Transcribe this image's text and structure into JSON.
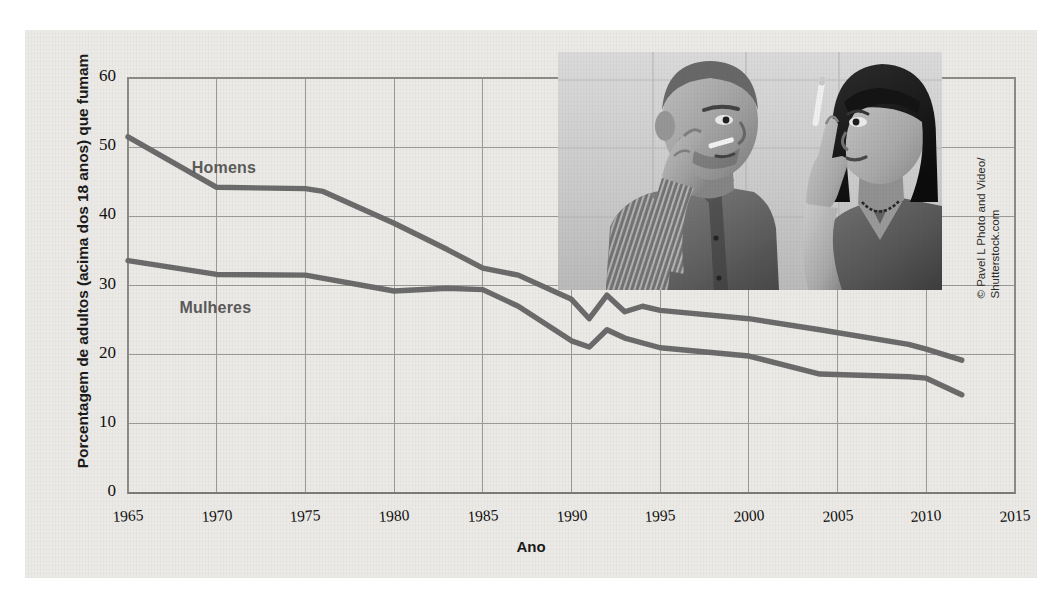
{
  "figure": {
    "background_color": "#eceae6",
    "credit": {
      "line1": "© Pavel L Photo and Video/",
      "line2": "Shutterstock.com"
    },
    "photo_alt": "Homem e mulher fumando cigarros"
  },
  "chart_data": {
    "type": "line",
    "title": "",
    "xlabel": "Ano",
    "ylabel": "Porcentagem de adultos (acima dos 18 anos) que fumam",
    "xlim": [
      1965,
      2015
    ],
    "ylim": [
      0,
      60
    ],
    "xticks": [
      1965,
      1970,
      1975,
      1980,
      1985,
      1990,
      1995,
      2000,
      2005,
      2010,
      2015
    ],
    "yticks": [
      0,
      10,
      20,
      30,
      40,
      50,
      60
    ],
    "grid": true,
    "legend_position": "inline-labels",
    "line_color": "#6b6b6b",
    "grid_color": "#9a9a98",
    "series": [
      {
        "name": "Homens",
        "label_x": 1968.6,
        "label_y": 46.8,
        "x": [
          1965,
          1970,
          1975,
          1976,
          1980,
          1983,
          1985,
          1987,
          1990,
          1991,
          1992,
          1993,
          1994,
          1995,
          2000,
          2004,
          2009,
          2010,
          2012
        ],
        "values": [
          51.5,
          44.2,
          44.0,
          43.6,
          39.0,
          35.2,
          32.5,
          31.5,
          28.0,
          25.2,
          28.6,
          26.2,
          27.0,
          26.4,
          25.2,
          23.6,
          21.5,
          20.8,
          19.2
        ]
      },
      {
        "name": "Mulheres",
        "label_x": 1967.9,
        "label_y": 26.6,
        "x": [
          1965,
          1970,
          1975,
          1980,
          1983,
          1985,
          1987,
          1990,
          1991,
          1992,
          1993,
          1995,
          2000,
          2004,
          2009,
          2010,
          2012
        ],
        "values": [
          33.6,
          31.6,
          31.5,
          29.2,
          29.6,
          29.4,
          27.0,
          22.0,
          21.1,
          23.6,
          22.4,
          21.0,
          19.8,
          17.2,
          16.8,
          16.6,
          14.2
        ]
      }
    ]
  }
}
